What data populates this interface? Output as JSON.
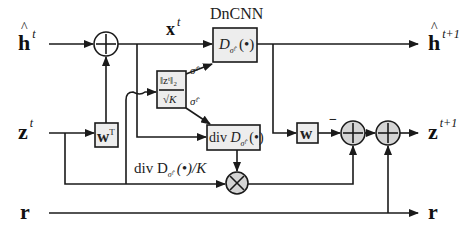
{
  "diagram": {
    "title": "DnCNN",
    "colors": {
      "line": "#1a1a1a",
      "box_fill": "#ededed",
      "node_fill": "#d4d4d4",
      "background": "#ffffff"
    },
    "inputs": [
      {
        "id": "h_t",
        "symbol": "h",
        "superscript": "t",
        "hat": true
      },
      {
        "id": "z_t",
        "symbol": "z",
        "superscript": "t"
      },
      {
        "id": "r_in",
        "symbol": "r"
      }
    ],
    "outputs": [
      {
        "id": "h_t1",
        "symbol": "h",
        "superscript": "t+1",
        "hat": true
      },
      {
        "id": "z_t1",
        "symbol": "z",
        "superscript": "t+1"
      },
      {
        "id": "r_out",
        "symbol": "r"
      }
    ],
    "intermediate": {
      "x_symbol": "x",
      "x_superscript": "t"
    },
    "blocks": {
      "denoiser": {
        "label": "D",
        "subscript": "σ̂ᵗ",
        "arg": "(•)"
      },
      "divergence": {
        "prefix": "div",
        "label": "D",
        "subscript": "σ̂ᵗ",
        "arg": "(•)"
      },
      "sigma_est": {
        "numerator": "‖zᵗ‖₂",
        "denominator": "√K",
        "out_top": "σ̂ᵗ",
        "out_bottom": "σ̂ᵗ"
      },
      "w_transpose": {
        "symbol": "w",
        "superscript": "T"
      },
      "w": {
        "symbol": "w",
        "sign": "−"
      }
    },
    "annotations": {
      "div_over_k": "div D",
      "div_sub": "σ̂ᵗ",
      "div_tail": "(•)/K"
    },
    "nodes": {
      "sum_top": "+",
      "mult": "×",
      "sum_mid1": "+",
      "sum_mid2": "+"
    }
  }
}
